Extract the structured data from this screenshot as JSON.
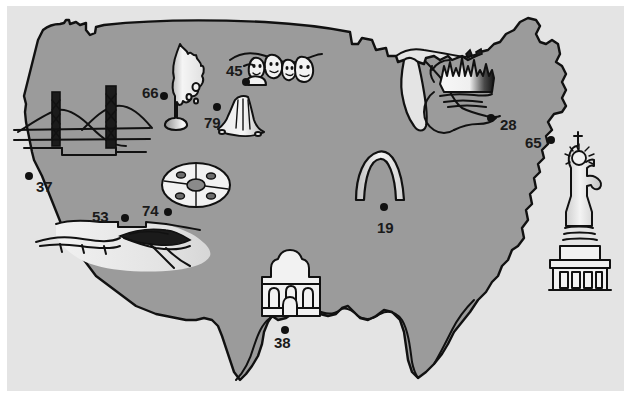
{
  "figure": {
    "kind": "illustrated-map",
    "background_color": "#e4e4e4",
    "paper_color": "#ffffff",
    "land_color": "#9b9b9b",
    "ink_color": "#111111",
    "width": 631,
    "height": 398
  },
  "markers": [
    {
      "id": "marker-66",
      "label": "66",
      "landmark": "old-faithful-geyser",
      "label_x": 142,
      "label_y": 98,
      "dot_x": 164,
      "dot_y": 96
    },
    {
      "id": "marker-45",
      "label": "45",
      "landmark": "mount-rushmore",
      "label_x": 226,
      "label_y": 76,
      "dot_x": 246,
      "dot_y": 82
    },
    {
      "id": "marker-79",
      "label": "79",
      "landmark": "devils-tower",
      "label_x": 204,
      "label_y": 128,
      "dot_x": 217,
      "dot_y": 107
    },
    {
      "id": "marker-28",
      "label": "28",
      "landmark": "chicago-skyline",
      "label_x": 500,
      "label_y": 130,
      "dot_x": 491,
      "dot_y": 118
    },
    {
      "id": "marker-65",
      "label": "65",
      "landmark": "northeast-coast",
      "label_x": 525,
      "label_y": 148,
      "dot_x": 551,
      "dot_y": 140
    },
    {
      "id": "marker-37",
      "label": "37",
      "landmark": "golden-gate-bridge",
      "label_x": 36,
      "label_y": 192,
      "dot_x": 29,
      "dot_y": 176
    },
    {
      "id": "marker-19",
      "label": "19",
      "landmark": "gateway-arch",
      "label_x": 377,
      "label_y": 233,
      "dot_x": 384,
      "dot_y": 207
    },
    {
      "id": "marker-74",
      "label": "74",
      "landmark": "grand-canyon-east",
      "label_x": 142,
      "label_y": 216,
      "dot_x": 168,
      "dot_y": 212
    },
    {
      "id": "marker-53",
      "label": "53",
      "landmark": "grand-canyon-west",
      "label_x": 92,
      "label_y": 222,
      "dot_x": 125,
      "dot_y": 218
    },
    {
      "id": "marker-38",
      "label": "38",
      "landmark": "the-alamo",
      "label_x": 274,
      "label_y": 348,
      "dot_x": 285,
      "dot_y": 330
    }
  ],
  "landmarks": [
    {
      "id": "old-faithful-geyser",
      "name": "Old Faithful geyser",
      "marker": "66"
    },
    {
      "id": "mount-rushmore",
      "name": "Mount Rushmore",
      "marker": "45"
    },
    {
      "id": "devils-tower",
      "name": "Devils Tower",
      "marker": "79"
    },
    {
      "id": "golden-gate-bridge",
      "name": "Golden Gate Bridge",
      "marker": "37"
    },
    {
      "id": "meteor-crater",
      "name": "Crater",
      "marker": ""
    },
    {
      "id": "grand-canyon",
      "name": "Grand Canyon",
      "marker": "53 / 74"
    },
    {
      "id": "the-alamo",
      "name": "The Alamo",
      "marker": "38"
    },
    {
      "id": "gateway-arch",
      "name": "Gateway Arch",
      "marker": "19"
    },
    {
      "id": "chicago-skyline",
      "name": "City skyline",
      "marker": "28"
    },
    {
      "id": "statue-of-liberty",
      "name": "Statue of Liberty",
      "marker": ""
    }
  ]
}
